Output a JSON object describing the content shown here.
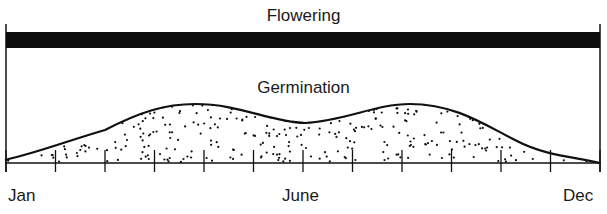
{
  "diagram": {
    "flowering_label": "Flowering",
    "germination_label": "Germination",
    "axis": {
      "month_labels": [
        {
          "text": "Jan",
          "x": 8
        },
        {
          "text": "June",
          "x": 282
        },
        {
          "text": "Dec",
          "x": 565
        }
      ],
      "tick_count": 13
    },
    "colors": {
      "ink": "#111111",
      "background": "#ffffff"
    }
  }
}
